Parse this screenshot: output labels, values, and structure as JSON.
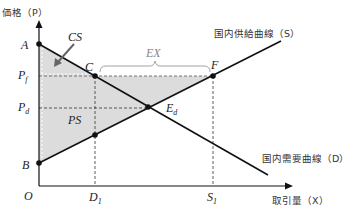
{
  "axes": {
    "y_label": "価格（P）",
    "x_label": "取引量（X）",
    "origin": "O"
  },
  "curves": {
    "supply_label": "国内供給曲線（S）",
    "demand_label": "国内需要曲線（D）"
  },
  "points": {
    "A": "A",
    "B": "B",
    "C": "C",
    "F": "F",
    "Ed": "E",
    "Ed_sub": "d"
  },
  "prices": {
    "Pf": "P",
    "Pf_sub": "f",
    "Pd": "P",
    "Pd_sub": "d"
  },
  "quantities": {
    "D1": "D",
    "D1_sub": "1",
    "S1": "S",
    "S1_sub": "1"
  },
  "areas": {
    "CS": "CS",
    "PS": "PS",
    "EX": "EX"
  },
  "colors": {
    "shade": "#d9d9d9",
    "line": "#111111",
    "bracket": "#999999"
  }
}
